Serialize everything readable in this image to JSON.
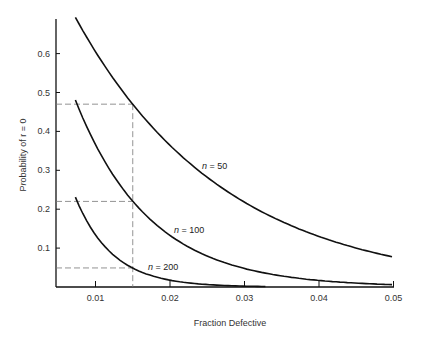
{
  "chart_data": {
    "type": "line",
    "title": "",
    "xlabel": "Fraction Defective",
    "ylabel": "Probability of r = 0",
    "xlim": [
      0.0,
      0.05
    ],
    "ylim": [
      0.0,
      0.7
    ],
    "grid": false,
    "legend": "inline labels",
    "x_ticks": [
      "0.01",
      "0.02",
      "0.03",
      "0.04",
      "0.05"
    ],
    "y_ticks": [
      "0.1",
      "0.2",
      "0.3",
      "0.4",
      "0.5",
      "0.6"
    ],
    "x": [
      0.007,
      0.01,
      0.015,
      0.02,
      0.025,
      0.03,
      0.035,
      0.04,
      0.045,
      0.05
    ],
    "series": [
      {
        "name": "n = 50",
        "label_italic_var": "n",
        "label_value": "50",
        "values": [
          0.7,
          0.605,
          0.47,
          0.364,
          0.282,
          0.218,
          0.168,
          0.13,
          0.1,
          0.077
        ]
      },
      {
        "name": "n = 100",
        "label_italic_var": "n",
        "label_value": "100",
        "values": [
          0.495,
          0.366,
          0.221,
          0.133,
          0.08,
          0.048,
          0.029,
          0.017,
          0.01,
          0.006
        ]
      },
      {
        "name": "n = 200",
        "label_italic_var": "n",
        "label_value": "200",
        "values": [
          0.245,
          0.134,
          0.049,
          0.018,
          0.006,
          0.002,
          0.001,
          0.0,
          0.0,
          0.0
        ]
      }
    ],
    "annotations": [
      {
        "type": "vertical-dashed",
        "x": 0.015
      },
      {
        "type": "horizontal-dashed",
        "y": 0.47,
        "label": "n = 50 at p = 0.015"
      },
      {
        "type": "horizontal-dashed",
        "y": 0.22,
        "label": "n = 100 at p = 0.015"
      },
      {
        "type": "horizontal-dashed",
        "y": 0.049,
        "label": "n = 200 at p = 0.015"
      }
    ]
  }
}
